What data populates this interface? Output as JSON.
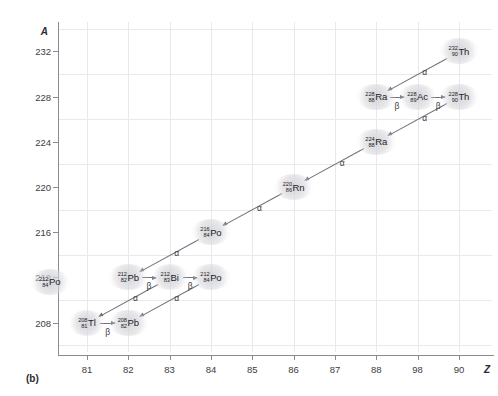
{
  "figure": {
    "caption": "(b)",
    "axis_y_name": "A",
    "axis_z_name": "Z"
  },
  "chart_data": {
    "type": "scatter",
    "title": "",
    "xlabel": "Z",
    "ylabel": "A",
    "xlim": [
      80.3,
      90.8
    ],
    "ylim": [
      205.4,
      234.6
    ],
    "xticks": [
      "81",
      "82",
      "83",
      "84",
      "85",
      "86",
      "87",
      "88",
      "98",
      "90"
    ],
    "xtick_values": [
      81,
      82,
      83,
      84,
      85,
      86,
      87,
      88,
      89,
      90
    ],
    "yticks": [
      "232",
      "228",
      "224",
      "220",
      "216",
      "212",
      "208"
    ],
    "ytick_values": [
      232,
      228,
      224,
      220,
      216,
      212,
      208
    ],
    "grid": true,
    "legend": "none",
    "nodes": [
      {
        "id": "th232",
        "mass": "232",
        "atomic": "90",
        "symbol": "Th",
        "Z": 90,
        "A": 232
      },
      {
        "id": "ra228",
        "mass": "228",
        "atomic": "88",
        "symbol": "Ra",
        "Z": 88,
        "A": 228
      },
      {
        "id": "ac228",
        "mass": "228",
        "atomic": "89",
        "symbol": "Ac",
        "Z": 89,
        "A": 228
      },
      {
        "id": "th228",
        "mass": "228",
        "atomic": "90",
        "symbol": "Th",
        "Z": 90,
        "A": 228
      },
      {
        "id": "ra224",
        "mass": "224",
        "atomic": "88",
        "symbol": "Ra",
        "Z": 88,
        "A": 224
      },
      {
        "id": "rn220",
        "mass": "220",
        "atomic": "86",
        "symbol": "Rn",
        "Z": 86,
        "A": 220
      },
      {
        "id": "po216",
        "mass": "216",
        "atomic": "84",
        "symbol": "Po",
        "Z": 84,
        "A": 216
      },
      {
        "id": "pb212",
        "mass": "212",
        "atomic": "82",
        "symbol": "Pb",
        "Z": 82,
        "A": 212
      },
      {
        "id": "bi212",
        "mass": "212",
        "atomic": "83",
        "symbol": "Bi",
        "Z": 83,
        "A": 212
      },
      {
        "id": "po212",
        "mass": "212",
        "atomic": "84",
        "symbol": "Po",
        "Z": 84,
        "A": 212
      },
      {
        "id": "tl208",
        "mass": "208",
        "atomic": "81",
        "symbol": "Tl",
        "Z": 81,
        "A": 208
      },
      {
        "id": "pb208",
        "mass": "208",
        "atomic": "82",
        "symbol": "Pb",
        "Z": 82,
        "A": 208
      },
      {
        "id": "po212_edge",
        "mass": "212",
        "atomic": "84",
        "symbol": "Po",
        "Z": 80.1,
        "A": 211.6
      }
    ],
    "decays": [
      {
        "from": "th232",
        "to": "ra228",
        "label": "α"
      },
      {
        "from": "ra228",
        "to": "ac228",
        "label": "β"
      },
      {
        "from": "ac228",
        "to": "th228",
        "label": "β"
      },
      {
        "from": "th228",
        "to": "ra224",
        "label": "α"
      },
      {
        "from": "ra224",
        "to": "rn220",
        "label": "α"
      },
      {
        "from": "rn220",
        "to": "po216",
        "label": "α"
      },
      {
        "from": "po216",
        "to": "pb212",
        "label": "α"
      },
      {
        "from": "pb212",
        "to": "bi212",
        "label": "β"
      },
      {
        "from": "bi212",
        "to": "po212",
        "label": "β"
      },
      {
        "from": "bi212",
        "to": "tl208",
        "label": "α"
      },
      {
        "from": "po212",
        "to": "pb208",
        "label": "α"
      },
      {
        "from": "tl208",
        "to": "pb208",
        "label": "β"
      }
    ]
  }
}
